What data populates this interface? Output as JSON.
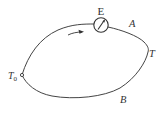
{
  "diagram": {
    "type": "thermocouple-circuit",
    "meter": {
      "label": "E",
      "symbol": "galvanometer"
    },
    "labels": {
      "a": "A",
      "t": "T",
      "b": "B",
      "t0_main": "T",
      "t0_sub": "0"
    },
    "current_direction": "clockwise",
    "colors": {
      "line": "#444444",
      "text": "#333333",
      "background": "#ffffff"
    }
  }
}
